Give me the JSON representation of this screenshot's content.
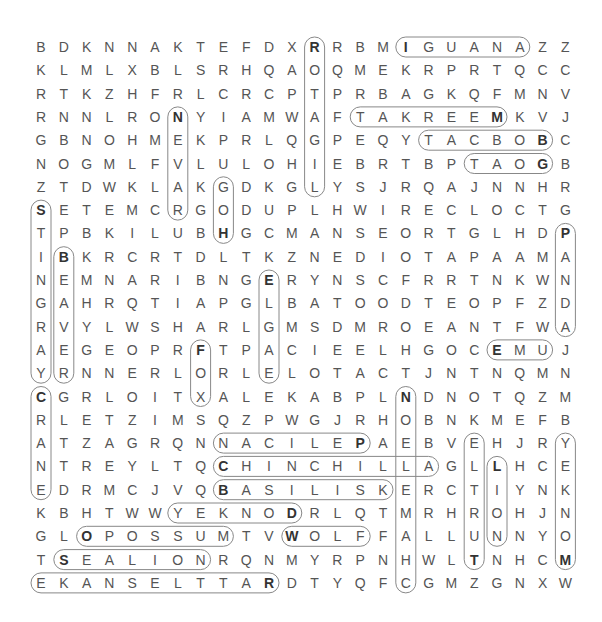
{
  "puzzle": {
    "type": "word-search",
    "rows": 24,
    "cols": 24,
    "grid": [
      "BDKNNAKTEFDXRRBMIGUANAZZ",
      "KLMLXBLSRHQAOQMEKRPRTQCC",
      "RTKZHFRLCRCPTPRBAGKQFMNV",
      "RNNLRONYIAMWAFTAKREEMKVJ",
      "GBNOHMEKPRLQGPEQYTACBOBC",
      "NOGMLFVLULOHIEBRTBPTAOGB",
      "ZTDWKLAKGDKGLYSJRQAJNNHR",
      "SETEMCRGODUPLHWIRECLOCTG",
      "TPBKILUBHGCMANSEORTGLHDP",
      "IBKRCRTDLTKZNEDIOTAPAAMA",
      "NEMNARIBNGERYNSCFRRTNKWN",
      "GAHRQTIAPGLBATOODTEOPFZD",
      "RVYLWSHARLGMSDMROEANTFWA",
      "AEGEOPRFTPACIEELHGOCEMUJ",
      "YRNNERLORLELOTACTJNTNQMN",
      "CGRLOITXALEKABPLNDNOTQZM",
      "RLETZIMSQZPWGJRHOBNKMEFB",
      "ATZAGRQNNACILEPAEBVEHJRY",
      "NTREYLTQCHINCHILLAGLLHCE",
      "EDRMCJVQBASILISKERCTIYNK",
      "KBHTWWYEKNODRLQTMRHROHJN",
      "GLOPOSSUMTVWOLFFALLUNNYO",
      "TSEALIONRQNMYRPNHWLTNHCM",
      "EKANSELTTARDTYQFCGMZGNXW"
    ],
    "found_words": [
      {
        "word": "IGUANA",
        "start": [
          0,
          16
        ],
        "end": [
          0,
          21
        ]
      },
      {
        "word": "MEERKAT",
        "start": [
          3,
          20
        ],
        "end": [
          3,
          14
        ]
      },
      {
        "word": "BOBCAT",
        "start": [
          4,
          22
        ],
        "end": [
          4,
          17
        ]
      },
      {
        "word": "GOAT",
        "start": [
          5,
          22
        ],
        "end": [
          5,
          19
        ]
      },
      {
        "word": "EMU",
        "start": [
          13,
          20
        ],
        "end": [
          13,
          22
        ]
      },
      {
        "word": "PELICAN",
        "start": [
          17,
          14
        ],
        "end": [
          17,
          8
        ]
      },
      {
        "word": "CHINCHILLA",
        "start": [
          18,
          8
        ],
        "end": [
          18,
          17
        ]
      },
      {
        "word": "BASILISK",
        "start": [
          19,
          8
        ],
        "end": [
          19,
          15
        ]
      },
      {
        "word": "DONKEY",
        "start": [
          20,
          11
        ],
        "end": [
          20,
          6
        ]
      },
      {
        "word": "OPOSSUM",
        "start": [
          21,
          2
        ],
        "end": [
          21,
          8
        ]
      },
      {
        "word": "WOLF",
        "start": [
          21,
          11
        ],
        "end": [
          21,
          14
        ]
      },
      {
        "word": "SEALION",
        "start": [
          22,
          1
        ],
        "end": [
          22,
          7
        ]
      },
      {
        "word": "RATTLESNAKE",
        "start": [
          23,
          10
        ],
        "end": [
          23,
          0
        ]
      },
      {
        "word": "GIRAFFE",
        "start": [
          0,
          12
        ],
        "end": [
          6,
          12
        ]
      },
      {
        "word": "STINGRAY",
        "start": [
          7,
          0
        ],
        "end": [
          14,
          0
        ]
      },
      {
        "word": "BEAVER",
        "start": [
          9,
          1
        ],
        "end": [
          14,
          1
        ]
      },
      {
        "word": "CRANE",
        "start": [
          15,
          0
        ],
        "end": [
          19,
          0
        ]
      },
      {
        "word": "FOX",
        "start": [
          13,
          7
        ],
        "end": [
          15,
          7
        ]
      },
      {
        "word": "EAGLE",
        "start": [
          10,
          10
        ],
        "end": [
          14,
          10
        ]
      },
      {
        "word": "NEVADA",
        "start": [
          3,
          6
        ],
        "end": [
          7,
          6
        ]
      },
      {
        "word": "HOG",
        "start": [
          8,
          8
        ],
        "end": [
          6,
          8
        ]
      },
      {
        "word": "PANDA",
        "start": [
          8,
          23
        ],
        "end": [
          12,
          23
        ]
      },
      {
        "word": "NOEMAHC",
        "start": [
          15,
          16
        ],
        "end": [
          23,
          16
        ]
      },
      {
        "word": "TURTLE",
        "start": [
          22,
          19
        ],
        "end": [
          17,
          19
        ]
      },
      {
        "word": "LION",
        "start": [
          18,
          20
        ],
        "end": [
          21,
          20
        ]
      },
      {
        "word": "MONKEY",
        "start": [
          22,
          23
        ],
        "end": [
          17,
          23
        ]
      }
    ]
  }
}
